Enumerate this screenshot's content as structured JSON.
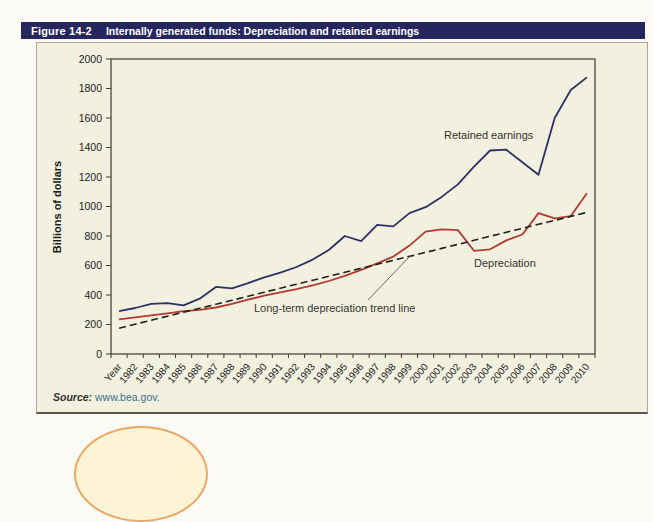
{
  "figure": {
    "label": "Figure 14-2",
    "title": "Internally generated funds: Depreciation and retained earnings",
    "source_prefix": "Source:",
    "source_link": "www.bea.gov."
  },
  "colors": {
    "title_bar_bg": "#26265e",
    "figure_bg": "#f2f0de",
    "retained_earnings_line": "#2f3066",
    "depreciation_line": "#b23a31",
    "trend_line": "#1f1f1c",
    "axis": "#3a3a33",
    "annotation_text": "#333330",
    "source_link": "#3f6e8e"
  },
  "chart_data": {
    "type": "line",
    "title": "",
    "xlabel": "",
    "ylabel": "Billions of dollars",
    "ylim": [
      0,
      2000
    ],
    "ytick_step": 200,
    "grid": false,
    "legend_position": "none",
    "categories": [
      "Year",
      "1982",
      "1983",
      "1984",
      "1985",
      "1986",
      "1987",
      "1988",
      "1989",
      "1990",
      "1991",
      "1992",
      "1993",
      "1994",
      "1995",
      "1996",
      "1997",
      "1998",
      "1999",
      "2000",
      "2001",
      "2002",
      "2003",
      "2004",
      "2005",
      "2006",
      "2007",
      "2008",
      "2009",
      "2010"
    ],
    "series": [
      {
        "name": "Retained earnings",
        "style": "solid",
        "color": "#2f3066",
        "values": [
          290,
          312,
          340,
          345,
          330,
          375,
          455,
          445,
          480,
          520,
          552,
          590,
          640,
          705,
          800,
          765,
          875,
          865,
          955,
          995,
          1065,
          1150,
          1270,
          1380,
          1385,
          1300,
          1215,
          1600,
          1790,
          1875
        ]
      },
      {
        "name": "Depreciation",
        "style": "solid",
        "color": "#b23a31",
        "values": [
          235,
          248,
          262,
          276,
          290,
          300,
          315,
          340,
          368,
          395,
          418,
          440,
          465,
          495,
          530,
          570,
          615,
          660,
          735,
          830,
          845,
          840,
          700,
          710,
          770,
          810,
          955,
          920,
          935,
          1090
        ]
      },
      {
        "name": "Long-term depreciation trend line",
        "style": "dashed",
        "color": "#1f1f1c",
        "values": [
          175,
          202,
          229,
          256,
          283,
          310,
          337,
          364,
          392,
          419,
          446,
          473,
          500,
          527,
          554,
          581,
          608,
          635,
          662,
          689,
          716,
          743,
          771,
          798,
          825,
          852,
          879,
          906,
          933,
          960
        ]
      }
    ],
    "annotations": [
      {
        "id": "retained-earnings-label",
        "text": "Retained earnings",
        "x": 407,
        "y": 96
      },
      {
        "id": "depreciation-label",
        "text": "Depreciation",
        "x": 437,
        "y": 224
      },
      {
        "id": "trend-label",
        "text": "Long-term depreciation trend line",
        "x": 217,
        "y": 269,
        "leader": {
          "x1": 331,
          "y1": 257,
          "x2": 374,
          "y2": 212
        }
      }
    ]
  }
}
